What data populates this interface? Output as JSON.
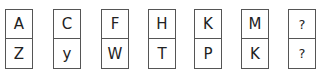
{
  "puzzle": {
    "cards": [
      {
        "top": "A",
        "bottom": "Z"
      },
      {
        "top": "C",
        "bottom": "y"
      },
      {
        "top": "F",
        "bottom": "W"
      },
      {
        "top": "H",
        "bottom": "T"
      },
      {
        "top": "K",
        "bottom": "P"
      },
      {
        "top": "M",
        "bottom": "K"
      },
      {
        "top": "?",
        "bottom": "?"
      }
    ]
  }
}
